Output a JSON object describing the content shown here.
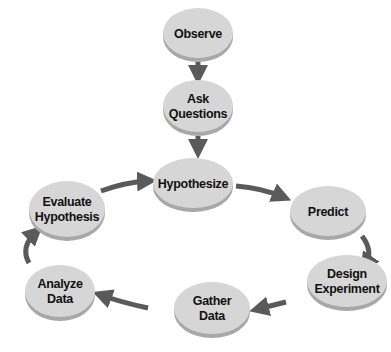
{
  "diagram": {
    "title": "",
    "colors": {
      "node_top": "#d6d6d6",
      "node_rim": "#a8a8a8",
      "arrow": "#5a5a5a",
      "text": "#111111"
    },
    "nodes": [
      {
        "id": "observe",
        "lines": [
          "Observe"
        ],
        "cx": 198,
        "cy": 33,
        "rx": 35,
        "ry": 25
      },
      {
        "id": "ask-questions",
        "lines": [
          "Ask",
          "Questions"
        ],
        "cx": 198,
        "cy": 106,
        "rx": 35,
        "ry": 26
      },
      {
        "id": "hypothesize",
        "lines": [
          "Hypothesize"
        ],
        "cx": 193,
        "cy": 183,
        "rx": 40,
        "ry": 25
      },
      {
        "id": "evaluate-hypothesis",
        "lines": [
          "Evaluate",
          "Hypothesis"
        ],
        "cx": 67,
        "cy": 209,
        "rx": 38,
        "ry": 28
      },
      {
        "id": "predict",
        "lines": [
          "Predict"
        ],
        "cx": 328,
        "cy": 211,
        "rx": 38,
        "ry": 25
      },
      {
        "id": "design-experiment",
        "lines": [
          "Design",
          "Experiment"
        ],
        "cx": 347,
        "cy": 281,
        "rx": 40,
        "ry": 26
      },
      {
        "id": "gather-data",
        "lines": [
          "Gather",
          "Data"
        ],
        "cx": 212,
        "cy": 308,
        "rx": 38,
        "ry": 26
      },
      {
        "id": "analyze-data",
        "lines": [
          "Analyze",
          "Data"
        ],
        "cx": 60,
        "cy": 291,
        "rx": 35,
        "ry": 26
      }
    ],
    "edges": [
      {
        "from": "observe",
        "to": "ask-questions"
      },
      {
        "from": "ask-questions",
        "to": "hypothesize"
      },
      {
        "from": "hypothesize",
        "to": "predict"
      },
      {
        "from": "predict",
        "to": "design-experiment"
      },
      {
        "from": "design-experiment",
        "to": "gather-data"
      },
      {
        "from": "gather-data",
        "to": "analyze-data"
      },
      {
        "from": "analyze-data",
        "to": "evaluate-hypothesis"
      },
      {
        "from": "evaluate-hypothesis",
        "to": "hypothesize"
      }
    ]
  }
}
